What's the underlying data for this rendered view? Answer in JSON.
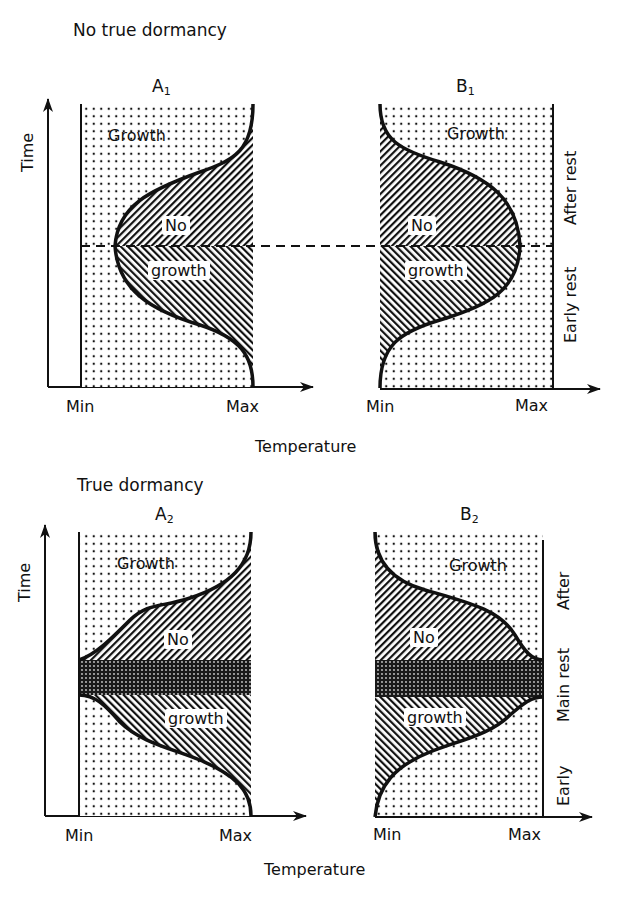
{
  "sections": [
    {
      "title": "No true dormancy",
      "panels": [
        {
          "id": "A1",
          "letter": "A",
          "subscript": "1"
        },
        {
          "id": "B1",
          "letter": "B",
          "subscript": "1"
        }
      ],
      "region_labels": {
        "growth": "Growth",
        "no": "No",
        "no_growth": "growth"
      },
      "x_ticks": {
        "min": "Min",
        "max": "Max"
      },
      "x_axis_title": "Temperature",
      "y_axis_title": "Time",
      "phase_labels": [
        "After rest",
        "Early rest"
      ]
    },
    {
      "title": "True dormancy",
      "panels": [
        {
          "id": "A2",
          "letter": "A",
          "subscript": "2"
        },
        {
          "id": "B2",
          "letter": "B",
          "subscript": "2"
        }
      ],
      "region_labels": {
        "growth": "Growth",
        "no": "No",
        "no_growth": "growth"
      },
      "x_ticks": {
        "min": "Min",
        "max": "Max"
      },
      "x_axis_title": "Temperature",
      "y_axis_title": "Time",
      "phase_labels": [
        "After",
        "Main rest",
        "Early"
      ]
    }
  ],
  "legend_patterns": {
    "growth": "dotted",
    "no_growth_upper": "hatch-forward",
    "no_growth_lower": "hatch-back",
    "main_rest_band": "dense-crosshatch"
  },
  "colors": {
    "ink": "#111111",
    "paper": "#ffffff"
  }
}
